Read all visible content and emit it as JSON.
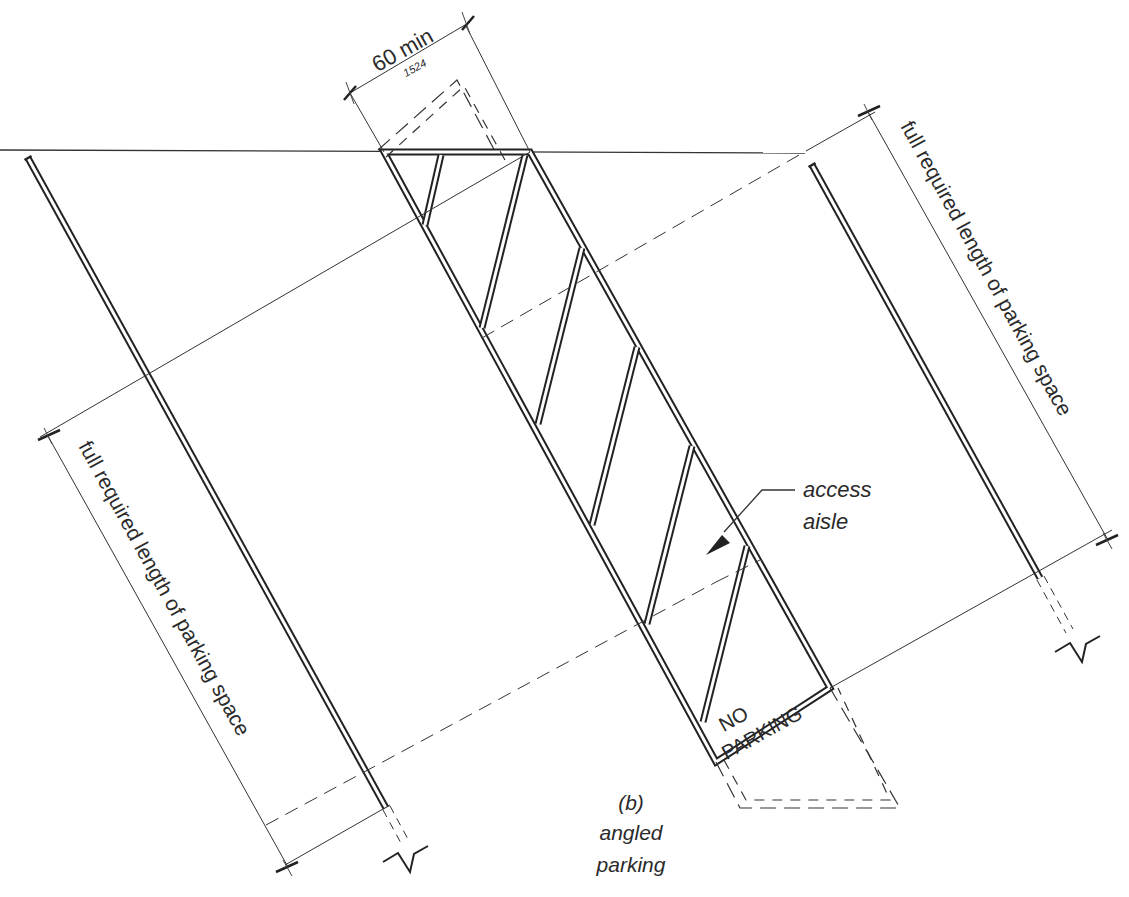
{
  "figure": {
    "caption_label": "(b)",
    "caption_line1": "angled",
    "caption_line2": "parking"
  },
  "dimensions": {
    "aisle_width": {
      "imperial": "60 min",
      "metric": "1524"
    },
    "left_length_label": "full required length of parking space",
    "right_length_label": "full required length of parking space"
  },
  "annotations": {
    "access_aisle_line1": "access",
    "access_aisle_line2": "aisle",
    "no_parking_line1": "NO",
    "no_parking_line2": "PARKING"
  },
  "colors": {
    "line": "#222222",
    "text": "#2a2a2a",
    "background": "#ffffff"
  }
}
